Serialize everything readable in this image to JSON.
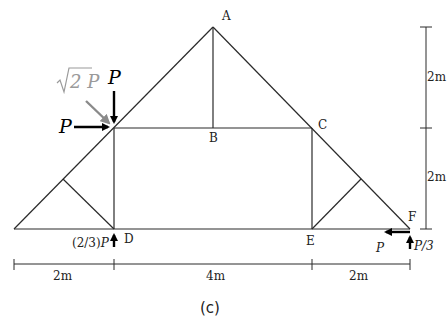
{
  "figure": {
    "caption": "(c)",
    "type": "truss free-body diagram"
  },
  "nodes": {
    "A": {
      "label": "A"
    },
    "B": {
      "label": "B"
    },
    "C": {
      "label": "C"
    },
    "D": {
      "label": "D"
    },
    "E": {
      "label": "E"
    },
    "F": {
      "label": "F"
    }
  },
  "loads": {
    "vertical_top": "P",
    "horizontal_left": "P",
    "resultant": "√2 P",
    "resultant_sqrt": "√",
    "resultant_rest": "2 P",
    "reaction_D": "(2/3)P",
    "reaction_D_coef": "(2/3)",
    "reaction_D_var": "P",
    "reaction_F_horizontal": "P",
    "reaction_F_vertical": "P/3"
  },
  "dimensions": {
    "horizontal": [
      "2m",
      "4m",
      "2m"
    ],
    "vertical": [
      "2m",
      "2m"
    ]
  },
  "colors": {
    "members": "#2a2a2a",
    "force_arrows": "#000000",
    "resultant_arrow": "#8a8a8a"
  }
}
